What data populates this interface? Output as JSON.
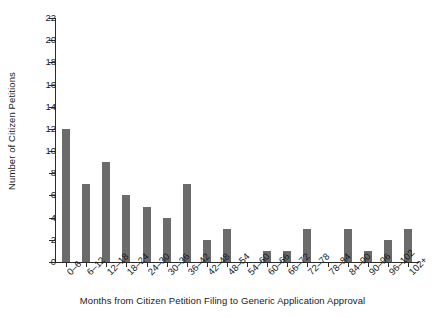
{
  "chart_data": {
    "type": "bar",
    "title": "",
    "xlabel": "Months from Citizen Petition Filing to Generic Application Approval",
    "ylabel": "Number of Citizen Petitions",
    "categories": [
      "0–6",
      "6–12",
      "12–18",
      "18–24",
      "24–30",
      "30–36",
      "36–42",
      "42–48",
      "48–54",
      "54–60",
      "60–66",
      "66–72",
      "72–78",
      "78–84",
      "84–90",
      "90–96",
      "96–102",
      "102+"
    ],
    "values": [
      12,
      7,
      9,
      6,
      5,
      4,
      7,
      2,
      3,
      0,
      1,
      1,
      3,
      0,
      3,
      1,
      2,
      3
    ],
    "ylim": [
      0,
      22
    ],
    "yticks": [
      0,
      2,
      4,
      6,
      8,
      10,
      12,
      14,
      16,
      18,
      20,
      22
    ],
    "ytick_labels": [
      "0",
      "2",
      "4",
      "6",
      "8",
      "10",
      "12",
      "14",
      "16",
      "18",
      "20",
      "22"
    ],
    "grid": false,
    "legend": null,
    "bar_color": "#6b6b6b",
    "axis_color": "#2b2b2b"
  }
}
